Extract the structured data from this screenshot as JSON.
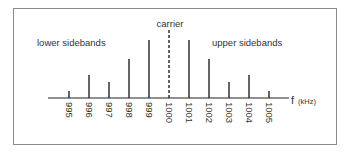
{
  "chart_data": {
    "type": "bar",
    "title": "",
    "xlabel": "f (kHz)",
    "ylabel": "",
    "categories": [
      "995",
      "996",
      "997",
      "998",
      "999",
      "1000",
      "1001",
      "1002",
      "1003",
      "1004",
      "1005"
    ],
    "values": [
      7,
      23,
      16,
      39,
      58,
      58,
      58,
      39,
      16,
      23,
      7
    ],
    "carrier_index": 5,
    "grid": false,
    "annotations": [
      "lower sidebands",
      "carrier",
      "upper sidebands"
    ]
  },
  "labels": {
    "lower": "lower sidebands",
    "carrier": "carrier",
    "upper": "upper sidebands",
    "axis_f": "f",
    "axis_unit": "(kHz)"
  }
}
